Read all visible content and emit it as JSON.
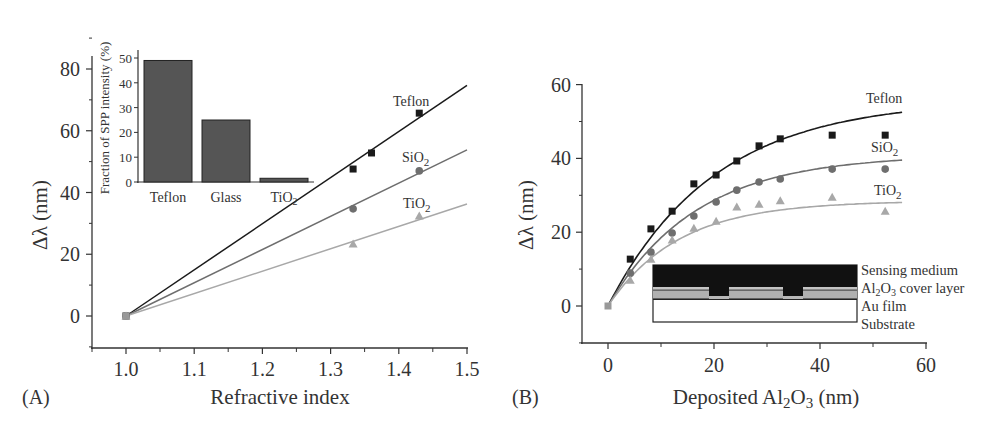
{
  "chart_data": [
    {
      "panel": "(A)",
      "type": "scatter",
      "xlabel": "Refractive index",
      "ylabel": "Δλ (nm)",
      "xlim": [
        0.95,
        1.5
      ],
      "ylim": [
        -10,
        85
      ],
      "xticks": [
        1.0,
        1.1,
        1.2,
        1.3,
        1.4,
        1.5
      ],
      "xtick_labels": [
        "1.0",
        "1.1",
        "1.2",
        "1.3",
        "1.4",
        "1.5"
      ],
      "yticks": [
        0,
        20,
        40,
        60,
        80
      ],
      "ytick_labels": [
        "0",
        "20",
        "40",
        "60",
        "80"
      ],
      "grid": false,
      "fit": "linear",
      "series": [
        {
          "name": "Teflon",
          "marker": "square",
          "color": "#1a1a1a",
          "x": [
            1.0,
            1.333,
            1.36,
            1.43
          ],
          "y": [
            0,
            47.6,
            52.8,
            65.7
          ],
          "fit_end": [
            1.5,
            74.7
          ]
        },
        {
          "name": "SiO2",
          "marker": "circle",
          "color": "#6e6e6e",
          "x": [
            1.0,
            1.333,
            1.43
          ],
          "y": [
            0,
            34.7,
            47.0
          ],
          "fit_end": [
            1.5,
            53.8
          ]
        },
        {
          "name": "TiO2",
          "marker": "triangle",
          "color": "#a8a8a8",
          "x": [
            1.0,
            1.333,
            1.43
          ],
          "y": [
            0,
            23.3,
            32.4
          ],
          "fit_end": [
            1.5,
            36.3
          ]
        }
      ],
      "inset": {
        "type": "bar",
        "ylabel": "Fraction of SPP intensity (%)",
        "categories": [
          "Teflon",
          "Glass",
          "TiO2"
        ],
        "values": [
          49,
          25,
          1.5
        ],
        "ylim": [
          0,
          50
        ],
        "yticks": [
          0,
          10,
          20,
          30,
          40,
          50
        ],
        "ytick_labels": [
          "0",
          "10",
          "20",
          "30",
          "40",
          "50"
        ],
        "bar_color": "#555555"
      }
    },
    {
      "panel": "(B)",
      "type": "scatter",
      "xlabel": "Deposited Al2O3 (nm)",
      "ylabel": "Δλ (nm)",
      "xlim": [
        -5,
        60
      ],
      "ylim": [
        -10,
        60
      ],
      "xticks": [
        0,
        20,
        40,
        60
      ],
      "xtick_labels": [
        "0",
        "20",
        "40",
        "60"
      ],
      "yticks": [
        0,
        20,
        40,
        60
      ],
      "ytick_labels": [
        "0",
        "20",
        "40",
        "60"
      ],
      "grid": false,
      "fit": "exponential saturation",
      "series": [
        {
          "name": "Teflon",
          "marker": "square",
          "color": "#1a1a1a",
          "x": [
            0,
            4.2,
            8.1,
            12.1,
            16.2,
            20.4,
            24.3,
            28.5,
            32.5,
            42.3,
            52.3
          ],
          "y": [
            0,
            12.7,
            20.9,
            25.7,
            33.1,
            35.5,
            39.3,
            43.4,
            45.3,
            46.3,
            46.3
          ],
          "fit_plateau": 56,
          "fit_rate": 0.05
        },
        {
          "name": "SiO2",
          "marker": "circle",
          "color": "#6e6e6e",
          "x": [
            0,
            4.2,
            8.1,
            12.1,
            16.2,
            20.4,
            24.3,
            28.5,
            32.5,
            42.3,
            52.3
          ],
          "y": [
            0,
            8.9,
            14.6,
            19.8,
            24.4,
            28.2,
            31.4,
            33.6,
            34.4,
            37.1,
            37.1
          ],
          "fit_plateau": 41,
          "fit_rate": 0.06
        },
        {
          "name": "TiO2",
          "marker": "triangle",
          "color": "#a8a8a8",
          "x": [
            0,
            4.2,
            8.1,
            12.1,
            16.2,
            20.4,
            24.3,
            28.5,
            32.5,
            42.3,
            52.3
          ],
          "y": [
            0,
            7.0,
            12.7,
            17.9,
            21.1,
            23.0,
            26.8,
            27.6,
            28.5,
            29.5,
            25.7
          ],
          "fit_plateau": 28.5,
          "fit_rate": 0.075
        }
      ],
      "inset": {
        "type": "diagram",
        "layers": [
          "Sensing medium",
          "Al2O3 cover layer",
          "Au film",
          "Substrate"
        ]
      }
    }
  ],
  "labels": {
    "panel_a": "(A)",
    "panel_b": "(B)",
    "a_xlabel": "Refractive index",
    "a_ylabel": "Δλ (nm)",
    "b_xlabel_pre": "Deposited Al",
    "b_xlabel_sub1": "2",
    "b_xlabel_mid": "O",
    "b_xlabel_sub2": "3",
    "b_xlabel_post": " (nm)",
    "b_ylabel": "Δλ (nm)",
    "teflon": "Teflon",
    "sio2_base": "SiO",
    "tio2_base": "TiO",
    "sub2": "2",
    "inset_ylabel": "Fraction of SPP intensity (%)",
    "layer_sensing": "Sensing medium",
    "layer_al2o3_a": "Al",
    "layer_al2o3_s1": "2",
    "layer_al2o3_b": "O",
    "layer_al2o3_s2": "3",
    "layer_al2o3_c": " cover layer",
    "layer_au": "Au film",
    "layer_substrate": "Substrate"
  }
}
